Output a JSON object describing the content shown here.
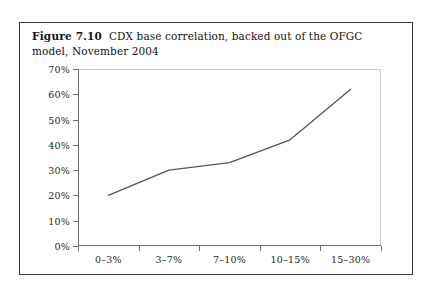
{
  "figure": {
    "label": "Figure 7.10",
    "title": "CDX base correlation, backed out of the OFGC model, November 2004"
  },
  "chart_data": {
    "type": "line",
    "title": "CDX base correlation, backed out of the OFGC model, November 2004",
    "categories": [
      "0–3%",
      "3–7%",
      "7–10%",
      "10–15%",
      "15–30%"
    ],
    "values": [
      20,
      30,
      33,
      42,
      62
    ],
    "value_labels": [
      "20%",
      "30%",
      "33%",
      "42%",
      "62%"
    ],
    "xlabel": "",
    "ylabel": "",
    "ylim": [
      0,
      70
    ],
    "ytick_labels": [
      "0%",
      "10%",
      "20%",
      "30%",
      "40%",
      "50%",
      "60%",
      "70%"
    ],
    "ytick_values": [
      0,
      10,
      20,
      30,
      40,
      50,
      60,
      70
    ],
    "grid": false,
    "legend": false,
    "markers": false,
    "line_color": "#555555"
  }
}
